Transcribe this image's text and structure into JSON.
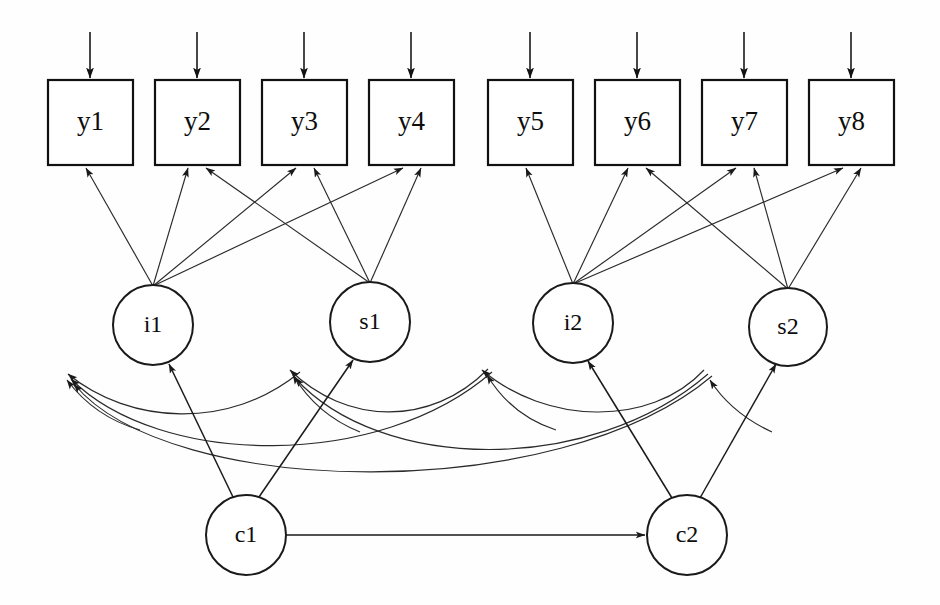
{
  "figure": {
    "type": "sem-path-diagram",
    "title": "",
    "background_color": "#fefefe",
    "line_color": "#2a2a2a",
    "canvas": {
      "width": 940,
      "height": 605
    }
  },
  "observed_variables": [
    {
      "id": "y1",
      "label": "y1",
      "x": 48,
      "y": 80,
      "w": 85,
      "h": 85
    },
    {
      "id": "y2",
      "label": "y2",
      "x": 155,
      "y": 80,
      "w": 85,
      "h": 85
    },
    {
      "id": "y3",
      "label": "y3",
      "x": 262,
      "y": 80,
      "w": 85,
      "h": 85
    },
    {
      "id": "y4",
      "label": "y4",
      "x": 369,
      "y": 80,
      "w": 85,
      "h": 85
    },
    {
      "id": "y5",
      "label": "y5",
      "x": 488,
      "y": 80,
      "w": 85,
      "h": 85
    },
    {
      "id": "y6",
      "label": "y6",
      "x": 595,
      "y": 80,
      "w": 85,
      "h": 85
    },
    {
      "id": "y7",
      "label": "y7",
      "x": 702,
      "y": 80,
      "w": 85,
      "h": 85
    },
    {
      "id": "y8",
      "label": "y8",
      "x": 809,
      "y": 80,
      "w": 85,
      "h": 85
    }
  ],
  "latent_variables": [
    {
      "id": "i1",
      "label": "i1",
      "cx": 153,
      "cy": 325,
      "r": 40
    },
    {
      "id": "s1",
      "label": "s1",
      "cx": 370,
      "cy": 322,
      "r": 40
    },
    {
      "id": "i2",
      "label": "i2",
      "cx": 573,
      "cy": 323,
      "r": 40
    },
    {
      "id": "s2",
      "label": "s2",
      "cx": 788,
      "cy": 327,
      "r": 39
    },
    {
      "id": "c1",
      "label": "c1",
      "cx": 246,
      "cy": 535,
      "r": 40
    },
    {
      "id": "c2",
      "label": "c2",
      "cx": 687,
      "cy": 535,
      "r": 40
    }
  ],
  "residual_arrows": [
    {
      "target": "y1",
      "x": 90,
      "y_from": 32,
      "y_to": 78
    },
    {
      "target": "y2",
      "x": 197,
      "y_from": 32,
      "y_to": 78
    },
    {
      "target": "y3",
      "x": 304,
      "y_from": 32,
      "y_to": 78
    },
    {
      "target": "y4",
      "x": 411,
      "y_from": 32,
      "y_to": 78
    },
    {
      "target": "y5",
      "x": 530,
      "y_from": 32,
      "y_to": 78
    },
    {
      "target": "y6",
      "x": 637,
      "y_from": 32,
      "y_to": 78
    },
    {
      "target": "y7",
      "x": 744,
      "y_from": 32,
      "y_to": 78
    },
    {
      "target": "y8",
      "x": 851,
      "y_from": 32,
      "y_to": 78
    }
  ],
  "loading_edges": [
    {
      "from": "i1",
      "to": "y1",
      "x1": 153,
      "y1": 286,
      "x2": 86,
      "y2": 168
    },
    {
      "from": "i1",
      "to": "y2",
      "x1": 153,
      "y1": 286,
      "x2": 188,
      "y2": 168
    },
    {
      "from": "i1",
      "to": "y3",
      "x1": 153,
      "y1": 286,
      "x2": 296,
      "y2": 168
    },
    {
      "from": "i1",
      "to": "y4",
      "x1": 153,
      "y1": 286,
      "x2": 403,
      "y2": 168
    },
    {
      "from": "s1",
      "to": "y2",
      "x1": 370,
      "y1": 283,
      "x2": 206,
      "y2": 168
    },
    {
      "from": "s1",
      "to": "y3",
      "x1": 370,
      "y1": 283,
      "x2": 314,
      "y2": 168
    },
    {
      "from": "s1",
      "to": "y4",
      "x1": 370,
      "y1": 283,
      "x2": 421,
      "y2": 168
    },
    {
      "from": "i2",
      "to": "y5",
      "x1": 573,
      "y1": 284,
      "x2": 526,
      "y2": 168
    },
    {
      "from": "i2",
      "to": "y6",
      "x1": 573,
      "y1": 284,
      "x2": 628,
      "y2": 168
    },
    {
      "from": "i2",
      "to": "y7",
      "x1": 573,
      "y1": 284,
      "x2": 736,
      "y2": 168
    },
    {
      "from": "i2",
      "to": "y8",
      "x1": 573,
      "y1": 284,
      "x2": 843,
      "y2": 168
    },
    {
      "from": "s2",
      "to": "y6",
      "x1": 788,
      "y1": 289,
      "x2": 646,
      "y2": 168
    },
    {
      "from": "s2",
      "to": "y7",
      "x1": 788,
      "y1": 289,
      "x2": 754,
      "y2": 168
    },
    {
      "from": "s2",
      "to": "y8",
      "x1": 788,
      "y1": 289,
      "x2": 861,
      "y2": 168
    }
  ],
  "structural_edges": [
    {
      "from": "c1",
      "to": "i1",
      "kind": "directed",
      "x1": 233,
      "y1": 497,
      "x2": 169,
      "y2": 364
    },
    {
      "from": "c1",
      "to": "s1",
      "kind": "directed",
      "x1": 259,
      "y1": 497,
      "x2": 353,
      "y2": 360
    },
    {
      "from": "c2",
      "to": "i2",
      "kind": "directed",
      "x1": 672,
      "y1": 498,
      "x2": 588,
      "y2": 361
    },
    {
      "from": "c2",
      "to": "s2",
      "kind": "directed",
      "x1": 700,
      "y1": 498,
      "x2": 776,
      "y2": 364
    },
    {
      "from": "c1",
      "to": "c2",
      "kind": "directed-horizontal",
      "x1": 286,
      "y1": 535,
      "x2": 645,
      "y2": 535
    }
  ],
  "covariance_curves": [
    {
      "id": "cov-i1-a",
      "target": "i1",
      "head_x": 66,
      "head_y": 369
    },
    {
      "id": "cov-i1-b",
      "target": "i1",
      "head_x": 69,
      "head_y": 374
    },
    {
      "id": "cov-i1-c",
      "target": "i1",
      "head_x": 72,
      "head_y": 379
    },
    {
      "id": "cov-s1-a",
      "target": "s1",
      "head_x": 286,
      "head_y": 366
    },
    {
      "id": "cov-s1-b",
      "target": "s1",
      "head_x": 291,
      "head_y": 371
    },
    {
      "id": "cov-s1-c",
      "target": "s1",
      "head_x": 295,
      "head_y": 376
    },
    {
      "id": "cov-i2-a",
      "target": "i2",
      "head_x": 478,
      "head_y": 367
    },
    {
      "id": "cov-i2-b",
      "target": "i2",
      "head_x": 487,
      "head_y": 368
    },
    {
      "id": "cov-i2-c",
      "target": "i2",
      "head_x": 484,
      "head_y": 379
    },
    {
      "id": "cov-s2-a",
      "target": "s2",
      "head_x": 701,
      "head_y": 364
    },
    {
      "id": "cov-s2-b",
      "target": "s2",
      "head_x": 707,
      "head_y": 372
    },
    {
      "id": "cov-s2-c",
      "target": "s2",
      "head_x": 711,
      "head_y": 379
    }
  ]
}
